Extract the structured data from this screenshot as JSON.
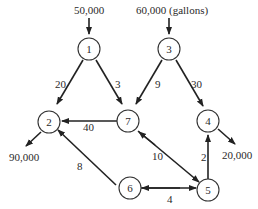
{
  "diagram": {
    "type": "network-flow",
    "units_note": "(gallons)",
    "nodes": [
      {
        "id": "1",
        "label": "1"
      },
      {
        "id": "2",
        "label": "2"
      },
      {
        "id": "3",
        "label": "3"
      },
      {
        "id": "4",
        "label": "4"
      },
      {
        "id": "5",
        "label": "5"
      },
      {
        "id": "6",
        "label": "6"
      },
      {
        "id": "7",
        "label": "7"
      }
    ],
    "edges": [
      {
        "from": "1",
        "to": "2",
        "label": "20"
      },
      {
        "from": "1",
        "to": "7",
        "label": "3"
      },
      {
        "from": "3",
        "to": "7",
        "label": "9"
      },
      {
        "from": "3",
        "to": "4",
        "label": "30"
      },
      {
        "from": "7",
        "to": "2",
        "label": "40"
      },
      {
        "from": "6",
        "to": "2",
        "label": "8"
      },
      {
        "from": "7",
        "to": "5",
        "label": "10",
        "bidirectional": true
      },
      {
        "from": "5",
        "to": "4",
        "label": "2"
      },
      {
        "from": "6",
        "to": "5",
        "label": "4",
        "bidirectional": true
      }
    ],
    "supplies": [
      {
        "node": "1",
        "label": "50,000"
      },
      {
        "node": "3",
        "label": "60,000 (gallons)"
      }
    ],
    "demands": [
      {
        "node": "2",
        "label": "90,000"
      },
      {
        "node": "4",
        "label": "20,000"
      }
    ]
  }
}
